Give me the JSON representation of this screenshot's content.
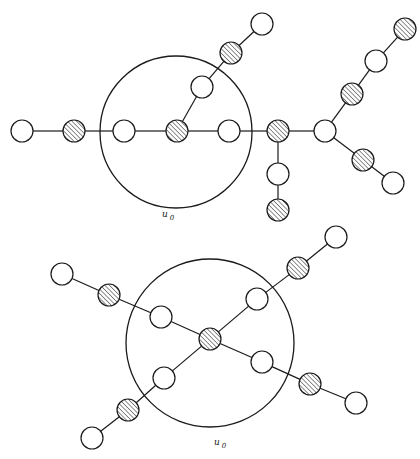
{
  "diagrams": [
    {
      "id": "top",
      "boundary": {
        "cx": 176,
        "cy": 132,
        "r": 76
      },
      "label": {
        "text": "u",
        "sub": "0",
        "x": 162,
        "y": 217
      },
      "node_radius": 11,
      "nodes": [
        {
          "x": 22,
          "y": 131,
          "type": "open"
        },
        {
          "x": 74,
          "y": 131,
          "type": "hatched"
        },
        {
          "x": 124,
          "y": 131,
          "type": "open"
        },
        {
          "x": 177,
          "y": 131,
          "type": "hatched"
        },
        {
          "x": 229,
          "y": 131,
          "type": "open"
        },
        {
          "x": 278,
          "y": 131,
          "type": "hatched"
        },
        {
          "x": 325,
          "y": 131,
          "type": "open"
        },
        {
          "x": 202,
          "y": 87,
          "type": "open"
        },
        {
          "x": 231,
          "y": 53,
          "type": "hatched"
        },
        {
          "x": 262,
          "y": 24,
          "type": "open"
        },
        {
          "x": 352,
          "y": 94,
          "type": "hatched"
        },
        {
          "x": 376,
          "y": 61,
          "type": "open"
        },
        {
          "x": 405,
          "y": 29,
          "type": "hatched"
        },
        {
          "x": 363,
          "y": 160,
          "type": "hatched"
        },
        {
          "x": 393,
          "y": 183,
          "type": "open"
        },
        {
          "x": 278,
          "y": 174,
          "type": "open"
        },
        {
          "x": 278,
          "y": 210,
          "type": "hatched"
        }
      ],
      "edges": [
        [
          0,
          1
        ],
        [
          1,
          2
        ],
        [
          2,
          3
        ],
        [
          3,
          4
        ],
        [
          4,
          5
        ],
        [
          5,
          6
        ],
        [
          3,
          7
        ],
        [
          7,
          8
        ],
        [
          8,
          9
        ],
        [
          6,
          10
        ],
        [
          10,
          11
        ],
        [
          11,
          12
        ],
        [
          6,
          13
        ],
        [
          13,
          14
        ],
        [
          5,
          15
        ],
        [
          15,
          16
        ]
      ]
    },
    {
      "id": "bottom",
      "boundary": {
        "cx": 210,
        "cy": 343,
        "r": 84
      },
      "label": {
        "text": "u",
        "sub": "0",
        "x": 214,
        "y": 445
      },
      "node_radius": 11,
      "nodes": [
        {
          "x": 210,
          "y": 339,
          "type": "hatched"
        },
        {
          "x": 161,
          "y": 317,
          "type": "open"
        },
        {
          "x": 109,
          "y": 295,
          "type": "hatched"
        },
        {
          "x": 62,
          "y": 274,
          "type": "open"
        },
        {
          "x": 257,
          "y": 299,
          "type": "open"
        },
        {
          "x": 298,
          "y": 268,
          "type": "hatched"
        },
        {
          "x": 336,
          "y": 237,
          "type": "open"
        },
        {
          "x": 262,
          "y": 362,
          "type": "open"
        },
        {
          "x": 310,
          "y": 384,
          "type": "hatched"
        },
        {
          "x": 356,
          "y": 403,
          "type": "open"
        },
        {
          "x": 164,
          "y": 378,
          "type": "open"
        },
        {
          "x": 128,
          "y": 410,
          "type": "hatched"
        },
        {
          "x": 92,
          "y": 438,
          "type": "open"
        }
      ],
      "edges": [
        [
          0,
          1
        ],
        [
          1,
          2
        ],
        [
          2,
          3
        ],
        [
          0,
          4
        ],
        [
          4,
          5
        ],
        [
          5,
          6
        ],
        [
          0,
          7
        ],
        [
          7,
          8
        ],
        [
          8,
          9
        ],
        [
          0,
          10
        ],
        [
          10,
          11
        ],
        [
          11,
          12
        ]
      ]
    }
  ],
  "legend": {
    "open_node": "white circle",
    "hatched_node": "diagonally hatched circle"
  }
}
